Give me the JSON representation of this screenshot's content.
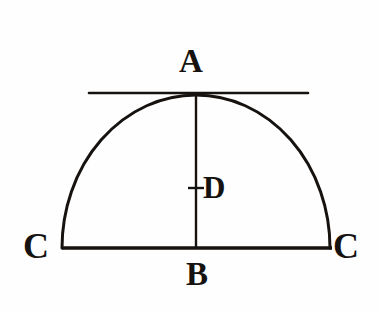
{
  "figure": {
    "kind": "geometry-diagram",
    "background_color": "#fefefe",
    "ink_color": "#16120f",
    "labels": [
      {
        "id": "apex",
        "text": "A",
        "role": "apex-point-label",
        "x": 196,
        "y": 62
      },
      {
        "id": "center",
        "text": "D",
        "role": "axis-midpoint-label",
        "x": 214,
        "y": 188
      },
      {
        "id": "foot",
        "text": "B",
        "role": "base-midpoint-label",
        "x": 196,
        "y": 274
      },
      {
        "id": "left-end",
        "text": "C",
        "role": "base-left-endpoint-label",
        "x": 36,
        "y": 247
      },
      {
        "id": "right-end",
        "text": "C",
        "role": "base-right-endpoint-label",
        "x": 346,
        "y": 247
      }
    ],
    "elements": [
      {
        "id": "tangent-line",
        "kind": "line",
        "name": "horizontal-tangent-line",
        "x1": 89,
        "y1": 93,
        "x2": 308,
        "y2": 93
      },
      {
        "id": "dome-arc",
        "kind": "arc",
        "name": "semi-elliptical-dome-arc",
        "cx": 196,
        "cy": 248,
        "rx": 134,
        "ry": 153
      },
      {
        "id": "base-chord",
        "kind": "line",
        "name": "base-chord-c-to-c",
        "x1": 62,
        "y1": 248,
        "x2": 332,
        "y2": 248
      },
      {
        "id": "vertical-axis",
        "kind": "line",
        "name": "vertical-axis-a-to-b",
        "x1": 196,
        "y1": 94,
        "x2": 196,
        "y2": 249
      },
      {
        "id": "center-tick",
        "kind": "line",
        "name": "axis-midpoint-tick",
        "x1": 188,
        "y1": 188,
        "x2": 204,
        "y2": 188
      }
    ],
    "stroke_widths": {
      "tangent": 2.6,
      "arc": 3.0,
      "base": 3.4,
      "axis": 2.4,
      "tick": 2.4
    }
  }
}
